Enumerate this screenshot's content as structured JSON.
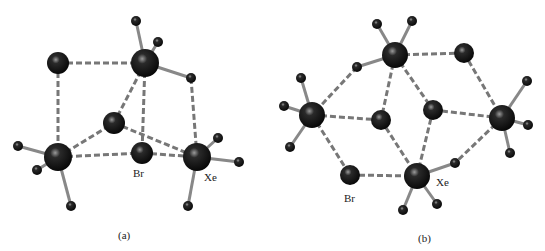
{
  "figure": {
    "panels": [
      {
        "id": "a",
        "caption": "(a)",
        "labels": {
          "br": "Br",
          "xe": "Xe"
        }
      },
      {
        "id": "b",
        "caption": "(b)",
        "labels": {
          "br": "Br",
          "xe": "Xe"
        }
      }
    ],
    "colors": {
      "atom": "#111111",
      "bond": "#777777",
      "dashed": "#666666",
      "text": "#222222"
    }
  }
}
